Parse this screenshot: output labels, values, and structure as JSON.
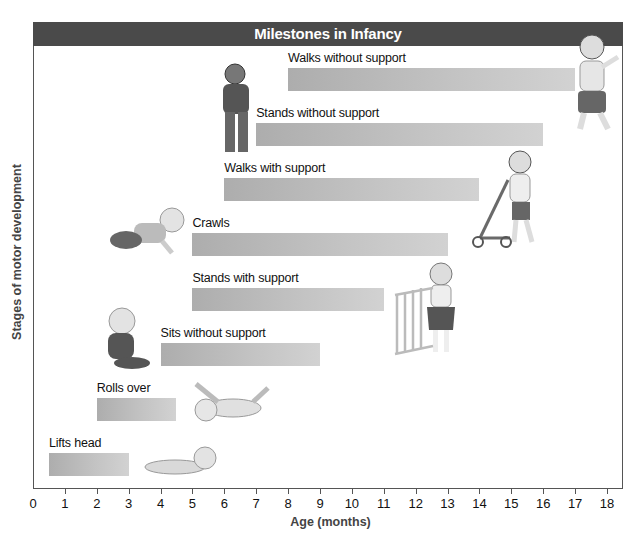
{
  "chart_data": {
    "type": "bar",
    "orientation": "horizontal-range",
    "title": "Milestones in Infancy",
    "xlabel": "Age (months)",
    "ylabel": "Stages of motor development",
    "xlim": [
      0,
      18
    ],
    "x_ticks": [
      "0",
      "1",
      "2",
      "3",
      "4",
      "5",
      "6",
      "7",
      "8",
      "9",
      "10",
      "11",
      "12",
      "13",
      "14",
      "15",
      "16",
      "17",
      "18"
    ],
    "categories": [
      "Lifts head",
      "Rolls over",
      "Sits without support",
      "Stands with support",
      "Crawls",
      "Walks with support",
      "Stands without support",
      "Walks without support"
    ],
    "ranges": [
      {
        "label": "Lifts head",
        "start": 0.5,
        "end": 3
      },
      {
        "label": "Rolls over",
        "start": 2,
        "end": 4.5
      },
      {
        "label": "Sits without support",
        "start": 4,
        "end": 9
      },
      {
        "label": "Stands with support",
        "start": 5,
        "end": 11
      },
      {
        "label": "Crawls",
        "start": 5,
        "end": 13
      },
      {
        "label": "Walks with support",
        "start": 6,
        "end": 14
      },
      {
        "label": "Stands without support",
        "start": 7,
        "end": 16
      },
      {
        "label": "Walks without support",
        "start": 8,
        "end": 17
      }
    ],
    "grid": false,
    "legend": null
  },
  "colors": {
    "title_bar": "#4a4a4a",
    "bar_start": "#adadad",
    "bar_end": "#d2d2d2",
    "frame": "#555555"
  }
}
